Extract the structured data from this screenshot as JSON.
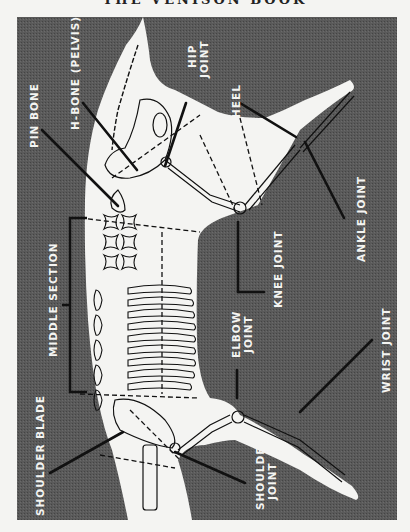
{
  "page": {
    "running_header": "THE VENISON BOOK"
  },
  "diagram": {
    "orientation": "rotated 90° counter-clockwise",
    "colors": {
      "panel": "#555555",
      "body": "#f4f4f2",
      "line": "#111111",
      "label": "#f4f4f2"
    },
    "labels": {
      "pin_bone": "PIN BONE",
      "h_bone": "H-BONE (PELVIS)",
      "hip_joint_1": "HIP",
      "hip_joint_2": "JOINT",
      "heel": "HEEL",
      "ankle_joint": "ANKLE JOINT",
      "knee_joint": "KNEE JOINT",
      "middle_section": "MIDDLE SECTION",
      "elbow_joint_1": "ELBOW",
      "elbow_joint_2": "JOINT",
      "wrist_joint": "WRIST JOINT",
      "shoulder_blade": "SHOULDER BLADE",
      "shoulder_joint_1": "SHOULDER",
      "shoulder_joint_2": "JOINT"
    }
  }
}
